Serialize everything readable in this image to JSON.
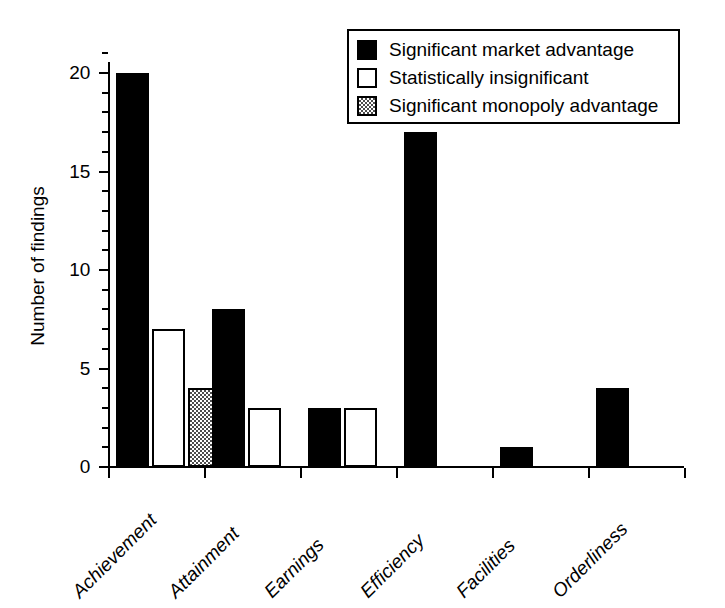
{
  "chart_data": {
    "type": "bar",
    "title": "",
    "xlabel": "",
    "ylabel": "Number of findings",
    "ylim": [
      0,
      21
    ],
    "yticks": [
      0,
      5,
      10,
      15,
      20
    ],
    "ytick_labels": [
      "0",
      "5",
      "10",
      "15",
      "20"
    ],
    "yminor_step": 1,
    "grid": false,
    "legend_position": "top-right",
    "categories": [
      "Achievement",
      "Attainment",
      "Earnings",
      "Efficiency",
      "Facilities",
      "Orderliness"
    ],
    "series": [
      {
        "name": "Significant market advantage",
        "fill": "solid-black",
        "color": "#000000",
        "values": [
          20,
          8,
          3,
          17,
          1,
          4
        ]
      },
      {
        "name": "Statistically insignificant",
        "fill": "open-white",
        "color": "#ffffff",
        "values": [
          7,
          3,
          3,
          0,
          0,
          0
        ]
      },
      {
        "name": "Significant monopoly advantage",
        "fill": "checkerboard-gray",
        "color": "#4d4d4d",
        "values": [
          4,
          0,
          0,
          0,
          0,
          0
        ]
      }
    ]
  },
  "axes": {
    "y_title": "Number of findings",
    "y_labels": [
      "20",
      "15",
      "10",
      "5",
      "0"
    ],
    "x_labels": [
      "Achievement",
      "Attainment",
      "Earnings",
      "Efficiency",
      "Facilities",
      "Orderliness"
    ]
  },
  "legend": {
    "entries": [
      {
        "label": "Significant market advantage",
        "swatch": "black-square-icon"
      },
      {
        "label": "Statistically insignificant",
        "swatch": "white-square-icon"
      },
      {
        "label": "Significant monopoly advantage",
        "swatch": "gray-square-icon"
      }
    ]
  },
  "colors": {
    "bar_black": "#000000",
    "bar_white": "#ffffff",
    "bar_gray": "#4d4d4d",
    "axis": "#000000",
    "background": "#ffffff"
  }
}
